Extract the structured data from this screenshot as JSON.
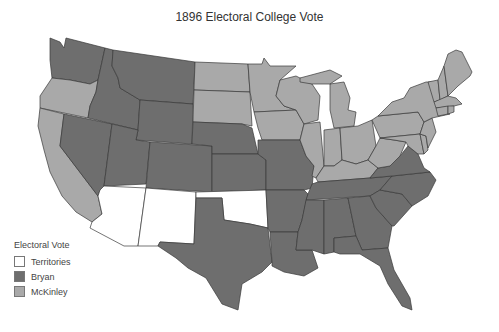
{
  "title": "1896 Electoral College Vote",
  "colors": {
    "territories": "#ffffff",
    "bryan": "#6e6e6e",
    "mckinley": "#a9a9a9",
    "border": "#3a3a3a"
  },
  "legend": {
    "title": "Electoral Vote",
    "items": [
      {
        "label": "Territories",
        "key": "territories"
      },
      {
        "label": "Bryan",
        "key": "bryan"
      },
      {
        "label": "McKinley",
        "key": "mckinley"
      }
    ]
  },
  "states": {
    "WA": "bryan",
    "OR": "mckinley",
    "CA": "mckinley",
    "NV": "bryan",
    "ID": "bryan",
    "MT": "bryan",
    "WY": "bryan",
    "UT": "bryan",
    "CO": "bryan",
    "AZ": "territories",
    "NM": "territories",
    "OK": "territories",
    "ND": "mckinley",
    "SD": "mckinley",
    "NE": "bryan",
    "KS": "bryan",
    "TX": "bryan",
    "MN": "mckinley",
    "IA": "mckinley",
    "MO": "bryan",
    "AR": "bryan",
    "LA": "bryan",
    "WI": "mckinley",
    "IL": "mckinley",
    "MI": "mckinley",
    "IN": "mckinley",
    "OH": "mckinley",
    "KY": "mckinley",
    "TN": "bryan",
    "MS": "bryan",
    "AL": "bryan",
    "GA": "bryan",
    "FL": "bryan",
    "SC": "bryan",
    "NC": "bryan",
    "VA": "bryan",
    "WV": "mckinley",
    "MD": "mckinley",
    "DE": "mckinley",
    "PA": "mckinley",
    "NJ": "mckinley",
    "NY": "mckinley",
    "CT": "mckinley",
    "RI": "mckinley",
    "MA": "mckinley",
    "VT": "mckinley",
    "NH": "mckinley",
    "ME": "mckinley"
  }
}
